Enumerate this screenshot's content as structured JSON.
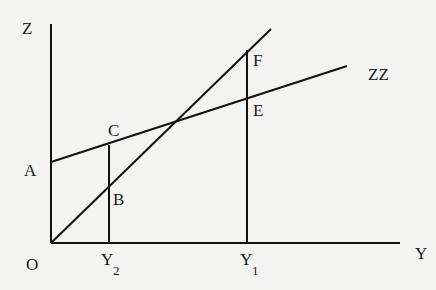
{
  "diagram": {
    "type": "economics-line-diagram",
    "axes": {
      "vertical": {
        "label": "Z"
      },
      "horizontal": {
        "label": "Y"
      },
      "origin": {
        "label": "O"
      }
    },
    "lines": [
      {
        "name": "45-degree line",
        "from": "O",
        "to": "top-right"
      },
      {
        "name": "ZZ",
        "label": "ZZ",
        "intercept_label": "A"
      }
    ],
    "points": {
      "A": "A",
      "B": "B",
      "C": "C",
      "E": "E",
      "F": "F"
    },
    "x_markers": [
      {
        "base": "Y",
        "sub": "2"
      },
      {
        "base": "Y",
        "sub": "1"
      }
    ]
  },
  "geometry": {
    "origin": [
      51,
      243
    ],
    "z_axis_top": [
      51,
      24
    ],
    "y_axis_end": [
      400,
      243
    ],
    "line45_end": [
      271,
      29
    ],
    "zz_start": [
      51,
      162
    ],
    "zz_end": [
      347,
      66
    ],
    "y2_x": 109,
    "y2_top": 145,
    "y1_x": 247,
    "y1_top": 50
  },
  "colors": {
    "background": "#f3f3f1",
    "ink": "#111111"
  }
}
